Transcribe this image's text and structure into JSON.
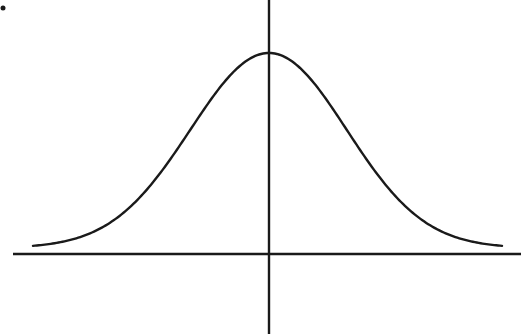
{
  "chart_data": {
    "type": "line",
    "title": "",
    "subtitle": "",
    "xlabel": "",
    "ylabel": "",
    "series": [
      {
        "name": "standard normal density",
        "function": "bell-curve",
        "mean": 0,
        "x_range": [
          -3,
          3
        ],
        "x": [
          -3,
          -2.5,
          -2,
          -1.5,
          -1,
          -0.5,
          0,
          0.5,
          1,
          1.5,
          2,
          2.5,
          3
        ],
        "values": [
          0.004,
          0.018,
          0.054,
          0.13,
          0.242,
          0.352,
          0.399,
          0.352,
          0.242,
          0.13,
          0.054,
          0.018,
          0.004
        ]
      }
    ],
    "xlim": [
      -3.4,
      3.2
    ],
    "ylim": [
      -0.2,
      0.52
    ],
    "grid": false,
    "legend": "none",
    "axes": {
      "x_axis_visible": true,
      "y_axis_visible": true,
      "tick_labels": false
    }
  },
  "colors": {
    "background": "#ffffff",
    "line": "#1a1a1a",
    "axis": "#1a1a1a"
  }
}
